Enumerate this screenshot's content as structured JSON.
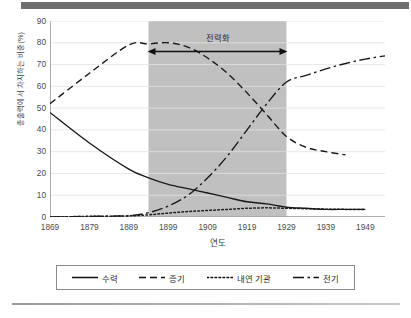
{
  "chart_data": {
    "type": "line",
    "title": "",
    "xlabel": "연도",
    "ylabel": "총출력에서 차지하는 비중(%)",
    "xlim": [
      1869,
      1954
    ],
    "ylim": [
      0,
      90
    ],
    "ytick_step": 10,
    "yticks": [
      0,
      10,
      20,
      30,
      40,
      50,
      60,
      70,
      80,
      90
    ],
    "xticks": [
      1869,
      1879,
      1889,
      1899,
      1909,
      1919,
      1929,
      1939,
      1949
    ],
    "grid": "horizontal",
    "legend_position": "below-plot",
    "x": [
      1869,
      1879,
      1889,
      1894,
      1899,
      1904,
      1909,
      1914,
      1919,
      1924,
      1929,
      1934,
      1939,
      1944,
      1949,
      1954
    ],
    "series": [
      {
        "name": "수력",
        "style": "solid",
        "color": "#1a1a1a",
        "values": [
          48,
          34,
          22,
          18,
          15,
          13,
          11,
          9,
          7,
          6,
          4.5,
          4,
          3.5,
          3.5,
          3.5,
          null
        ]
      },
      {
        "name": "증기",
        "style": "dashed",
        "color": "#1a1a1a",
        "values": [
          52,
          66,
          79,
          79.5,
          80,
          78,
          73,
          66,
          57,
          47,
          37,
          32,
          30,
          28.5,
          null,
          null
        ]
      },
      {
        "name": "내연 기관",
        "style": "dotted",
        "color": "#1a1a1a",
        "values": [
          0,
          0.3,
          0.5,
          1,
          1.8,
          2.5,
          3,
          3.5,
          4,
          4.2,
          4,
          3.8,
          3.6,
          3.5,
          3.5,
          null
        ]
      },
      {
        "name": "전기",
        "style": "dashdot",
        "color": "#1a1a1a",
        "values": [
          0,
          0.3,
          0.6,
          2,
          5,
          10,
          18,
          28,
          40,
          52,
          62,
          65,
          68,
          70.5,
          72.5,
          74
        ]
      }
    ],
    "shaded_band": {
      "label": "전력화",
      "x_start": 1894,
      "x_end": 1929,
      "color": "#c0c0c0",
      "label_y": 83,
      "arrow_y": 76
    }
  },
  "legend": {
    "items": [
      {
        "label": "수력",
        "style": "solid"
      },
      {
        "label": "증기",
        "style": "dashed"
      },
      {
        "label": "내연 기관",
        "style": "dotted"
      },
      {
        "label": "전기",
        "style": "dashdot"
      }
    ]
  }
}
